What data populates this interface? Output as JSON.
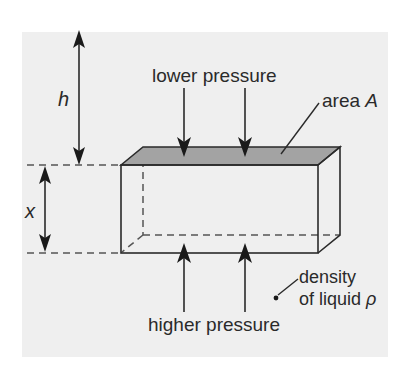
{
  "diagram": {
    "labels": {
      "lower_pressure": "lower pressure",
      "higher_pressure": "higher pressure",
      "area_prefix": "area ",
      "area_symbol": "A",
      "depth_symbol": "h",
      "height_symbol": "x",
      "density_line1": "density",
      "density_line2": "of liquid ",
      "density_symbol": "ρ"
    },
    "colors": {
      "background": "#efefef",
      "top_face": "#a3a3a3",
      "ink": "#2a2a2a",
      "dashes": "#555555"
    }
  }
}
